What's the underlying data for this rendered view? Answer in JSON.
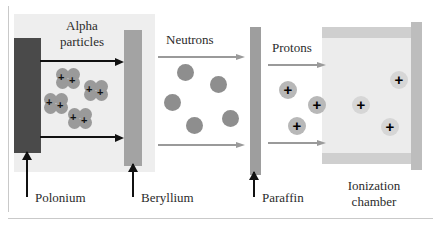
{
  "figure": {
    "background": "#ffffff"
  },
  "colors": {
    "polonium_bar": "#4a4a4a",
    "beryllium_bar": "#a3a3a3",
    "paraffin_bar": "#9e9e9e",
    "chamber_wall": "#cfcfcf",
    "chamber_interior": "#ececec",
    "panel_background": "#eeeeee",
    "neutron_fill": "#8e8e8e",
    "alpha_fill": "#9a9a9a",
    "proton_fill": "#b8b8b8",
    "arrow_dark": "#111111",
    "arrow_grey": "#9a9a9a"
  },
  "stage_labels": {
    "alpha_line1": "Alpha",
    "alpha_line2": "particles",
    "neutrons": "Neutrons",
    "protons": "Protons"
  },
  "component_labels": {
    "polonium": "Polonium",
    "beryllium": "Beryllium",
    "paraffin": "Paraffin",
    "chamber_line1": "Ionization",
    "chamber_line2": "chamber"
  },
  "particles": {
    "alpha": {
      "label": "alpha-particle",
      "charge_symbol": "+",
      "count": 4,
      "positions": [
        {
          "x": 56,
          "y": 68
        },
        {
          "x": 84,
          "y": 80
        },
        {
          "x": 44,
          "y": 93
        },
        {
          "x": 68,
          "y": 108
        }
      ]
    },
    "neutron": {
      "label": "neutron",
      "charge_symbol": "",
      "count": 5,
      "positions": [
        {
          "x": 177,
          "y": 64
        },
        {
          "x": 210,
          "y": 76
        },
        {
          "x": 164,
          "y": 94
        },
        {
          "x": 222,
          "y": 110
        },
        {
          "x": 186,
          "y": 117
        }
      ]
    },
    "proton_gap": {
      "label": "proton",
      "charge_symbol": "+",
      "count": 3,
      "positions": [
        {
          "x": 279,
          "y": 81
        },
        {
          "x": 308,
          "y": 96
        },
        {
          "x": 288,
          "y": 117
        }
      ]
    },
    "proton_chamber": {
      "label": "proton",
      "charge_symbol": "+",
      "count": 3,
      "positions": [
        {
          "x": 390,
          "y": 71
        },
        {
          "x": 352,
          "y": 96
        },
        {
          "x": 381,
          "y": 118
        }
      ]
    }
  },
  "arrows": {
    "alpha_top": {
      "name": "alpha-beam-top",
      "style": "dark"
    },
    "alpha_bottom": {
      "name": "alpha-beam-bottom",
      "style": "dark"
    },
    "neutron_top": {
      "name": "neutron-beam-top",
      "style": "grey"
    },
    "neutron_bottom": {
      "name": "neutron-beam-bottom",
      "style": "grey"
    },
    "proton_top": {
      "name": "proton-beam-top",
      "style": "grey"
    },
    "proton_bottom": {
      "name": "proton-beam-bottom",
      "style": "grey"
    }
  }
}
